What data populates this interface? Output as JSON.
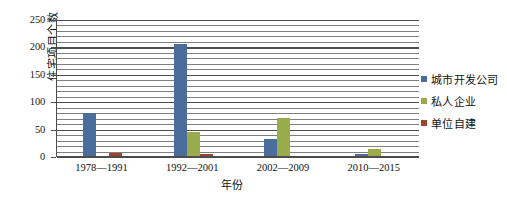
{
  "chart_data": {
    "type": "bar",
    "title": "",
    "xlabel": "年份",
    "ylabel": "住宅项目个数",
    "categories": [
      "1978—1991",
      "1992—2001",
      "2002—2009",
      "2010—2015"
    ],
    "series": [
      {
        "name": "城市开发公司",
        "color": "#4a6d9c",
        "values": [
          80,
          207,
          33,
          5
        ]
      },
      {
        "name": "私人企业",
        "color": "#9aab4b",
        "values": [
          0,
          45,
          72,
          15
        ]
      },
      {
        "name": "单位自建",
        "color": "#9c4331",
        "values": [
          8,
          5,
          0,
          0
        ]
      }
    ],
    "ylim": [
      0,
      250
    ],
    "y_ticks": [
      0,
      50,
      100,
      150,
      200,
      250
    ],
    "y_tick_labels": [
      "0",
      "50",
      "100",
      "150",
      "200",
      "250"
    ],
    "minor_tick_step": 10,
    "grid": true,
    "legend_position": "right"
  }
}
